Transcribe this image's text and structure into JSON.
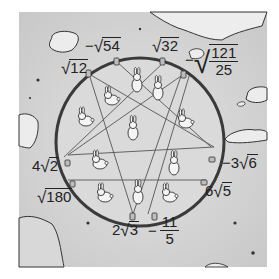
{
  "scene": {
    "description": "Hand-drawn map with a circular pen containing rabbits divided by a pentagram; radical-number labels around the circle",
    "colors": {
      "background": "#ffffff",
      "ground": "#d4d4d4",
      "ground_light": "#e6e6e6",
      "pen_fill": "#dcdcdc",
      "pen_ring": "#3a3a3a",
      "star_lines": "#555555",
      "water": "#ececec",
      "ink": "#222222"
    }
  },
  "labels": [
    {
      "id": "neg-sqrt-54",
      "sign": "−",
      "coef": "",
      "radicand": "54",
      "text": "−√54"
    },
    {
      "id": "sqrt-32",
      "sign": "",
      "coef": "",
      "radicand": "32",
      "text": "√32"
    },
    {
      "id": "sqrt-12",
      "sign": "",
      "coef": "",
      "radicand": "12",
      "text": "√12"
    },
    {
      "id": "neg-sqrt-121-25",
      "sign": "−",
      "numerator": "121",
      "denominator": "25",
      "text": "−√(121/25)"
    },
    {
      "id": "4-sqrt-2",
      "sign": "",
      "coef": "4",
      "radicand": "2",
      "text": "4√2"
    },
    {
      "id": "neg-3-sqrt-6",
      "sign": "−",
      "coef": "3",
      "radicand": "6",
      "text": "−3√6"
    },
    {
      "id": "sqrt-180",
      "sign": "",
      "coef": "",
      "radicand": "180",
      "text": "√180"
    },
    {
      "id": "6-sqrt-5",
      "sign": "",
      "coef": "6",
      "radicand": "5",
      "text": "6√5"
    },
    {
      "id": "2-sqrt-3",
      "sign": "",
      "coef": "2",
      "radicand": "3",
      "text": "2√3"
    },
    {
      "id": "neg-11-5",
      "sign": "−",
      "numerator": "11",
      "denominator": "5",
      "text": "−11/5"
    }
  ],
  "radical_symbol": "√",
  "rabbit_count": 11
}
